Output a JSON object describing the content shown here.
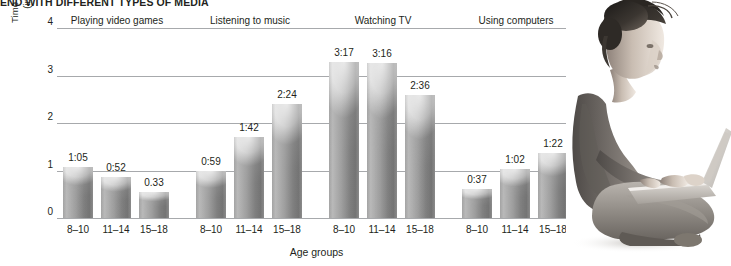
{
  "title": "END WITH DIFFERENT TYPES OF MEDIA",
  "axis": {
    "y_title_line1": "Time spent in activity per day",
    "y_title_line2": "(in hours and minutes)",
    "x_title": "Age groups"
  },
  "photo": {
    "alt": "woman-with-laptop-photo"
  },
  "chart_data": {
    "type": "bar",
    "title": "END WITH DIFFERENT TYPES OF MEDIA",
    "xlabel": "Age groups",
    "ylabel": "Time spent in activity per day (in hours and minutes)",
    "ylim": [
      0,
      4
    ],
    "yticks": [
      "0",
      "1",
      "2",
      "3",
      "4"
    ],
    "grid": true,
    "legend": "none",
    "categories": [
      "8–10",
      "11–14",
      "15–18"
    ],
    "groups": [
      {
        "name": "Playing video games",
        "labels": [
          "1:05",
          "0:52",
          "0.33"
        ],
        "values": [
          1.083,
          0.867,
          0.55
        ]
      },
      {
        "name": "Listening to music",
        "labels": [
          "0:59",
          "1:42",
          "2:24"
        ],
        "values": [
          0.983,
          1.7,
          2.4
        ]
      },
      {
        "name": "Watching TV",
        "labels": [
          "3:17",
          "3:16",
          "2:36"
        ],
        "values": [
          3.283,
          3.267,
          2.6
        ]
      },
      {
        "name": "Using computers",
        "labels": [
          "0:37",
          "1:02",
          "1:22"
        ],
        "values": [
          0.617,
          1.033,
          1.367
        ]
      }
    ]
  }
}
